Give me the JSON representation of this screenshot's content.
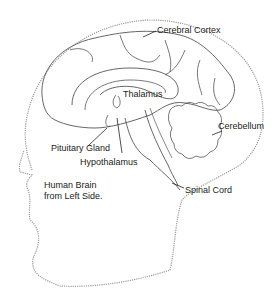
{
  "caption": {
    "line1": "Human Brain",
    "line2": "from Left Side."
  },
  "labels": {
    "cerebral_cortex": "Cerebral Cortex",
    "thalamus": "Thalamus",
    "cerebellum": "Cerebellum",
    "pituitary_gland": "Pituitary Gland",
    "hypothalamus": "Hypothalamus",
    "spinal_cord": "Spinal Cord"
  },
  "colors": {
    "outline": "#555555",
    "head_outline": "#9a9a9a",
    "text": "#222222"
  }
}
